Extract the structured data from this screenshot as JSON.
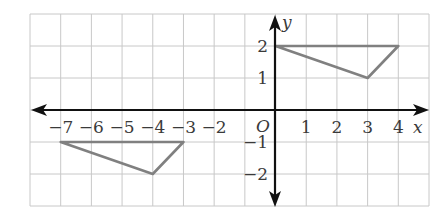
{
  "diagram": {
    "type": "coordinate-plane",
    "grid": {
      "x_min": -8,
      "x_max": 5,
      "y_min": -3,
      "y_max": 3
    },
    "axes": {
      "x_label": "x",
      "y_label": "y",
      "origin_label": "O"
    },
    "x_ticks": [
      {
        "value": -7,
        "label": "−7"
      },
      {
        "value": -6,
        "label": "−6"
      },
      {
        "value": -5,
        "label": "−5"
      },
      {
        "value": -4,
        "label": "−4"
      },
      {
        "value": -3,
        "label": "−3"
      },
      {
        "value": -2,
        "label": "−2"
      },
      {
        "value": 1,
        "label": "1"
      },
      {
        "value": 2,
        "label": "2"
      },
      {
        "value": 3,
        "label": "3"
      },
      {
        "value": 4,
        "label": "4"
      }
    ],
    "y_ticks": [
      {
        "value": 2,
        "label": "2"
      },
      {
        "value": 1,
        "label": "1"
      },
      {
        "value": -1,
        "label": "−1"
      },
      {
        "value": -2,
        "label": "−2"
      }
    ],
    "shapes": [
      {
        "name": "triangle-original",
        "vertices": [
          [
            0,
            2
          ],
          [
            4,
            2
          ],
          [
            3,
            1
          ]
        ]
      },
      {
        "name": "triangle-image",
        "vertices": [
          [
            -7,
            -1
          ],
          [
            -3,
            -1
          ],
          [
            -4,
            -2
          ]
        ]
      }
    ],
    "colors": {
      "grid": "#c8c8c8",
      "axis": "#111111",
      "shape": "#808080",
      "label": "#3a3a3a"
    }
  }
}
